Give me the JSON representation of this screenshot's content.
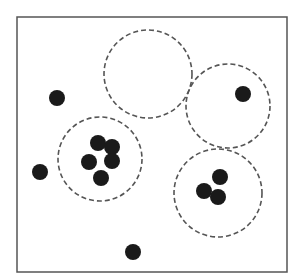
{
  "diagram": {
    "type": "cluster-coverage",
    "width": 297,
    "height": 279,
    "frame": {
      "x": 17,
      "y": 17,
      "width": 270,
      "height": 255,
      "stroke": "#555555"
    },
    "colors": {
      "background": "#ffffff",
      "point": "#1a1a1a",
      "circle_stroke": "#555555"
    },
    "point_radius": 8,
    "circles": [
      {
        "id": "top",
        "cx": 148,
        "cy": 74,
        "r": 44
      },
      {
        "id": "right-top",
        "cx": 228,
        "cy": 106,
        "r": 42
      },
      {
        "id": "left",
        "cx": 100,
        "cy": 159,
        "r": 42
      },
      {
        "id": "bottom-right",
        "cx": 218,
        "cy": 193,
        "r": 44
      }
    ],
    "points": [
      {
        "cx": 57,
        "cy": 98,
        "group": "outlier"
      },
      {
        "cx": 40,
        "cy": 172,
        "group": "outlier"
      },
      {
        "cx": 133,
        "cy": 252,
        "group": "outlier"
      },
      {
        "cx": 243,
        "cy": 94,
        "group": "right-top"
      },
      {
        "cx": 98,
        "cy": 143,
        "group": "left"
      },
      {
        "cx": 112,
        "cy": 147,
        "group": "left"
      },
      {
        "cx": 89,
        "cy": 162,
        "group": "left"
      },
      {
        "cx": 112,
        "cy": 161,
        "group": "left"
      },
      {
        "cx": 101,
        "cy": 178,
        "group": "left"
      },
      {
        "cx": 220,
        "cy": 177,
        "group": "bottom-right"
      },
      {
        "cx": 204,
        "cy": 191,
        "group": "bottom-right"
      },
      {
        "cx": 218,
        "cy": 197,
        "group": "bottom-right"
      }
    ]
  }
}
